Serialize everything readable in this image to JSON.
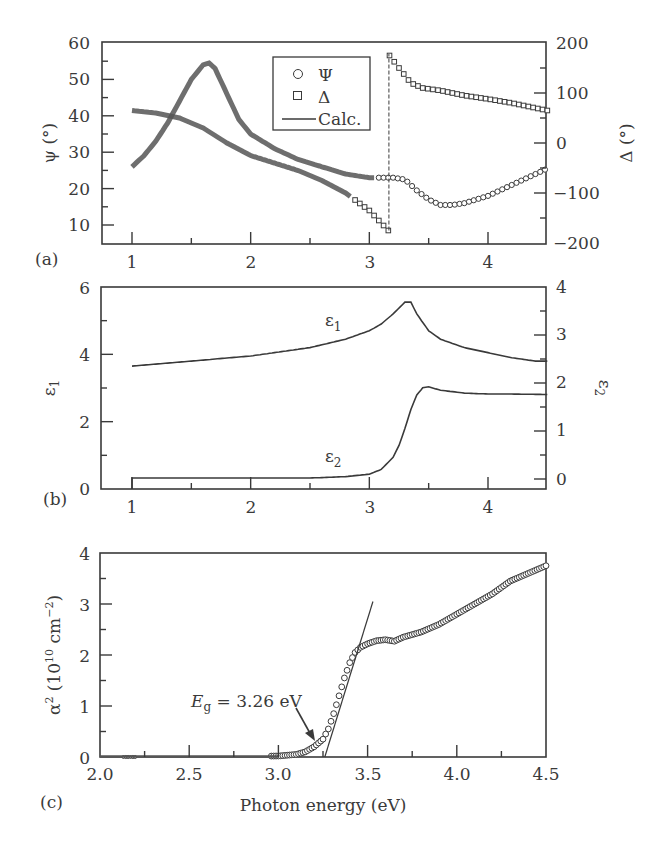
{
  "chart_data": [
    {
      "panel": "(a)",
      "type": "scatter",
      "title": "",
      "xlabel": "",
      "ylabel": "ψ (°)",
      "ylabel_right": "Δ (°)",
      "xlim": [
        0.75,
        4.5
      ],
      "ylim": [
        5,
        60
      ],
      "ylim_right": [
        -200,
        200
      ],
      "x_ticks": [
        1,
        2,
        3,
        4
      ],
      "y_ticks": [
        10,
        20,
        30,
        40,
        50,
        60
      ],
      "y_ticks_right": [
        -200,
        -100,
        0,
        100,
        200
      ],
      "grid": false,
      "legend": {
        "position": "upper center",
        "entries": [
          {
            "marker": "circle",
            "label": "Ψ"
          },
          {
            "marker": "square",
            "label": "Δ"
          },
          {
            "marker": "line",
            "label": "Calc."
          }
        ]
      },
      "series": [
        {
          "name": "Ψ",
          "axis": "left",
          "marker": "circle",
          "x": [
            1.0,
            1.1,
            1.2,
            1.3,
            1.4,
            1.5,
            1.6,
            1.65,
            1.7,
            1.8,
            1.9,
            2.0,
            2.2,
            2.4,
            2.6,
            2.8,
            3.0,
            3.1,
            3.2,
            3.3,
            3.4,
            3.5,
            3.6,
            3.7,
            3.8,
            3.9,
            4.0,
            4.1,
            4.2,
            4.3,
            4.4,
            4.5
          ],
          "y": [
            26,
            29,
            33,
            38,
            44,
            50,
            54,
            54.5,
            53,
            46,
            39,
            35,
            31,
            28,
            26,
            24,
            23,
            23,
            23,
            22.5,
            19.5,
            17,
            15.5,
            15.5,
            16,
            17,
            18,
            19.5,
            21,
            22.5,
            24,
            25.5
          ]
        },
        {
          "name": "Δ",
          "axis": "right",
          "marker": "square",
          "x": [
            1.0,
            1.2,
            1.4,
            1.6,
            1.8,
            2.0,
            2.2,
            2.4,
            2.6,
            2.8,
            3.0,
            3.1,
            3.16,
            3.17,
            3.25,
            3.35,
            3.45,
            3.6,
            3.8,
            4.0,
            4.2,
            4.4,
            4.5
          ],
          "y": [
            65,
            60,
            50,
            30,
            0,
            -25,
            -40,
            -55,
            -75,
            -100,
            -135,
            -160,
            -175,
            175,
            150,
            120,
            110,
            105,
            95,
            88,
            80,
            70,
            65
          ]
        },
        {
          "name": "Calc.",
          "type": "line",
          "axis": "both",
          "note": "model fit overlapping data"
        }
      ]
    },
    {
      "panel": "(b)",
      "type": "line",
      "title": "",
      "xlabel": "",
      "ylabel": "ε1",
      "ylabel_right": "ε2",
      "xlim": [
        0.75,
        4.5
      ],
      "ylim": [
        0,
        6
      ],
      "ylim_right": [
        -0.2,
        4
      ],
      "x_ticks": [
        1,
        2,
        3,
        4
      ],
      "y_ticks": [
        0,
        2,
        4,
        6
      ],
      "y_ticks_right": [
        0,
        1,
        2,
        3,
        4
      ],
      "grid": false,
      "annotations": [
        {
          "text": "ε1",
          "x": 3.0,
          "y": 5.0
        },
        {
          "text": "ε2",
          "x": 3.0,
          "y": 0.9
        }
      ],
      "series": [
        {
          "name": "ε1",
          "axis": "left",
          "x": [
            1.0,
            1.5,
            2.0,
            2.5,
            2.8,
            3.0,
            3.1,
            3.2,
            3.3,
            3.35,
            3.4,
            3.5,
            3.6,
            3.8,
            4.0,
            4.2,
            4.4,
            4.5
          ],
          "y": [
            3.65,
            3.8,
            3.95,
            4.2,
            4.45,
            4.7,
            4.9,
            5.2,
            5.55,
            5.55,
            5.2,
            4.7,
            4.45,
            4.2,
            4.05,
            3.9,
            3.8,
            3.8
          ]
        },
        {
          "name": "ε2",
          "axis": "right",
          "x": [
            1.0,
            1.5,
            2.0,
            2.5,
            2.8,
            3.0,
            3.1,
            3.2,
            3.25,
            3.3,
            3.35,
            3.4,
            3.45,
            3.5,
            3.6,
            3.8,
            4.0,
            4.2,
            4.5
          ],
          "y": [
            0.02,
            0.02,
            0.02,
            0.02,
            0.05,
            0.1,
            0.2,
            0.45,
            0.7,
            1.05,
            1.45,
            1.75,
            1.9,
            1.92,
            1.85,
            1.79,
            1.77,
            1.77,
            1.76
          ]
        }
      ]
    },
    {
      "panel": "(c)",
      "type": "scatter",
      "title": "",
      "xlabel": "Photon energy (eV)",
      "ylabel": "α² (10¹⁰ cm⁻²)",
      "xlim": [
        2.0,
        4.5
      ],
      "ylim": [
        0,
        4
      ],
      "x_ticks": [
        2.0,
        2.5,
        3.0,
        3.5,
        4.0,
        4.5
      ],
      "y_ticks": [
        0,
        1,
        2,
        3,
        4
      ],
      "grid": false,
      "annotations": [
        {
          "text": "Eg = 3.26 eV",
          "arrow_to": [
            3.23,
            0.3
          ]
        }
      ],
      "linear_fit": {
        "x": [
          3.26,
          3.53
        ],
        "y": [
          0,
          3.05
        ]
      },
      "series": [
        {
          "name": "α²",
          "marker": "circle",
          "x": [
            2.0,
            2.5,
            3.0,
            3.1,
            3.15,
            3.2,
            3.25,
            3.28,
            3.31,
            3.34,
            3.37,
            3.4,
            3.43,
            3.46,
            3.5,
            3.55,
            3.6,
            3.65,
            3.7,
            3.8,
            3.9,
            4.0,
            4.1,
            4.2,
            4.3,
            4.4,
            4.5
          ],
          "y": [
            0.0,
            0.0,
            0.02,
            0.05,
            0.1,
            0.2,
            0.35,
            0.55,
            0.85,
            1.2,
            1.55,
            1.85,
            2.05,
            2.15,
            2.22,
            2.28,
            2.3,
            2.27,
            2.35,
            2.45,
            2.6,
            2.8,
            3.0,
            3.2,
            3.45,
            3.6,
            3.75
          ]
        }
      ]
    }
  ],
  "labels": {
    "a": {
      "panel": "(a)",
      "ylabel": "ψ (°)",
      "ylabel_right": "Δ (°)",
      "x_ticks": [
        "1",
        "2",
        "3",
        "4"
      ],
      "y_ticks": [
        "10",
        "20",
        "30",
        "40",
        "50",
        "60"
      ],
      "y_ticks_right": [
        "−200",
        "−100",
        "0",
        "100",
        "200"
      ],
      "legend": {
        "psi": "Ψ",
        "delta": "Δ",
        "calc": "Calc."
      }
    },
    "b": {
      "panel": "(b)",
      "ylabel": "ε",
      "ylabel_sub": "1",
      "ylabel_right": "ε",
      "ylabel_right_sub": "2",
      "x_ticks": [
        "1",
        "2",
        "3",
        "4"
      ],
      "y_ticks": [
        "0",
        "2",
        "4",
        "6"
      ],
      "y_ticks_right": [
        "0",
        "1",
        "2",
        "3",
        "4"
      ],
      "curve_label_1": "ε",
      "curve_label_1_sub": "1",
      "curve_label_2": "ε",
      "curve_label_2_sub": "2"
    },
    "c": {
      "panel": "(c)",
      "ylabel": "α",
      "ylabel_sup": "2",
      "ylabel_unit_a": " (10",
      "ylabel_unit_sup": "10",
      "ylabel_unit_b": " cm",
      "ylabel_unit_sup2": "−2",
      "ylabel_unit_c": ")",
      "xlabel": "Photon energy (eV)",
      "x_ticks": [
        "2.0",
        "2.5",
        "3.0",
        "3.5",
        "4.0",
        "4.5"
      ],
      "y_ticks": [
        "0",
        "1",
        "2",
        "3",
        "4"
      ],
      "eg_E": "E",
      "eg_sub": "g",
      "eg_value": " = 3.26 eV"
    }
  }
}
